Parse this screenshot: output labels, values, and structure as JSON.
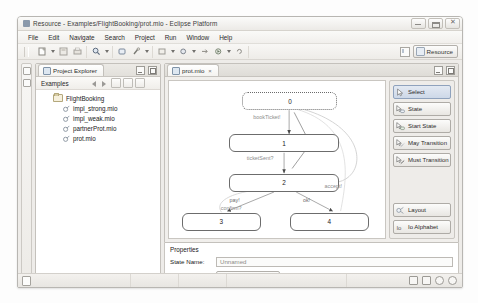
{
  "window": {
    "title": "Resource - Examples/FlightBooking/prot.mio - Eclipse Platform",
    "app_icon": "eclipse-icon",
    "buttons": {
      "minimize": "minimize-button",
      "maximize": "maximize-button",
      "close": "close-button"
    }
  },
  "menubar": {
    "items": [
      {
        "label": "File"
      },
      {
        "label": "Edit"
      },
      {
        "label": "Navigate"
      },
      {
        "label": "Search"
      },
      {
        "label": "Project"
      },
      {
        "label": "Run"
      },
      {
        "label": "Window"
      },
      {
        "label": "Help"
      }
    ]
  },
  "toolbar": {
    "groups": [
      {
        "icons": [
          "new-wizard-icon",
          "save-icon",
          "print-icon"
        ]
      },
      {
        "icons": [
          "search-icon"
        ]
      },
      {
        "icons": [
          "open-resource-icon",
          "build-icon"
        ]
      },
      {
        "icons": [
          "back-icon",
          "forward-icon",
          "next-annotation-icon",
          "debug-icon",
          "run-icon"
        ]
      }
    ],
    "perspective": {
      "switcher_icon": "open-perspective-icon",
      "active_label": "Resource",
      "active_icon": "resource-perspective-icon"
    }
  },
  "explorer": {
    "tab_label": "Project Explorer",
    "tab_icon": "project-explorer-icon",
    "root_label": "Examples",
    "tree": [
      {
        "label": "FlightBooking",
        "level": 1,
        "icon": "folder-icon"
      },
      {
        "label": "impl_strong.mio",
        "level": 2,
        "icon": "mio-file-icon"
      },
      {
        "label": "impl_weak.mio",
        "level": 2,
        "icon": "mio-file-icon"
      },
      {
        "label": "partnerProt.mio",
        "level": 2,
        "icon": "mio-file-icon"
      },
      {
        "label": "prot.mio",
        "level": 2,
        "icon": "mio-file-icon"
      }
    ],
    "view_controls": [
      "minimize-view-button",
      "maximize-view-button"
    ]
  },
  "editor": {
    "tab_label": "prot.mio",
    "tab_icon": "mio-file-icon",
    "tab_close": "×",
    "view_controls": [
      "minimize-editor-button",
      "maximize-editor-button"
    ]
  },
  "diagram": {
    "states": [
      {
        "id": "0",
        "label": "0",
        "x": 72,
        "y": 10,
        "w": 94,
        "h": 16,
        "style": "dashed"
      },
      {
        "id": "1",
        "label": "1",
        "x": 60,
        "y": 48,
        "w": 108,
        "h": 16,
        "style": "solid"
      },
      {
        "id": "2",
        "label": "2",
        "x": 60,
        "y": 83,
        "w": 108,
        "h": 16,
        "style": "solid"
      },
      {
        "id": "3",
        "label": "3",
        "x": 14,
        "y": 117,
        "w": 78,
        "h": 16,
        "style": "solid"
      },
      {
        "id": "4",
        "label": "4",
        "x": 120,
        "y": 117,
        "w": 78,
        "h": 16,
        "style": "solid"
      }
    ],
    "transitions": [
      {
        "from": "0",
        "to": "1",
        "label": "bookTicket!",
        "lx": 88,
        "ly": 31
      },
      {
        "from": "1",
        "to": "2",
        "label": "ticketSent?",
        "lx": 84,
        "ly": 67
      },
      {
        "from": "2",
        "to": "3",
        "label": "pay!",
        "lx": 66,
        "ly": 104
      },
      {
        "from": "2",
        "to": "4",
        "label": "ok!",
        "lx": 136,
        "ly": 104
      },
      {
        "from": "2",
        "to": "0",
        "label": "accept!",
        "lx": 158,
        "ly": 92
      },
      {
        "from": "3",
        "to": "2",
        "label": "confirm?",
        "lx": 60,
        "ly": 111
      }
    ]
  },
  "palette": {
    "tools": [
      {
        "label": "Select",
        "icon": "select-arrow-icon",
        "selected": true
      },
      {
        "label": "State",
        "icon": "state-tool-icon",
        "selected": false
      },
      {
        "label": "Start State",
        "icon": "start-state-tool-icon",
        "selected": false
      },
      {
        "label": "May Transition",
        "icon": "may-transition-tool-icon",
        "selected": false
      },
      {
        "label": "Must Transition",
        "icon": "must-transition-tool-icon",
        "selected": false
      }
    ],
    "actions": [
      {
        "label": "Layout",
        "icon": "layout-icon"
      },
      {
        "label": "Io Alphabet",
        "icon": "alphabet-icon"
      }
    ]
  },
  "properties": {
    "title": "Properties",
    "rows": [
      {
        "label": "State Name:",
        "value": "Unnamed",
        "type": "text"
      },
      {
        "label": "Start State:",
        "value": "Set as start state",
        "type": "button"
      }
    ]
  },
  "statusbar": {
    "left_icon": "writable-icon",
    "cells": [
      "",
      "",
      "",
      ""
    ],
    "right_icons": [
      "status-icon-1",
      "status-icon-2",
      "status-icon-3",
      "status-icon-4"
    ]
  }
}
